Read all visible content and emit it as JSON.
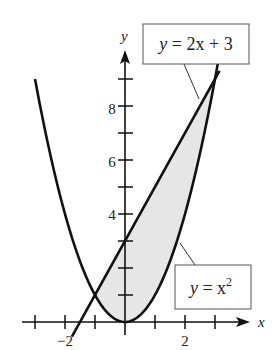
{
  "chart_data": {
    "type": "line",
    "title": "",
    "xlabel": "x",
    "ylabel": "y",
    "xlim": [
      -3.4,
      4.2
    ],
    "ylim": [
      -0.9,
      10
    ],
    "x_ticks": [
      -3,
      -2,
      -1,
      0,
      1,
      2,
      3
    ],
    "x_tick_labels": [
      {
        "value": -2,
        "label": "−2"
      },
      {
        "value": 2,
        "label": "2"
      }
    ],
    "y_ticks": [
      1,
      2,
      3,
      4,
      5,
      6,
      7,
      8,
      9
    ],
    "y_tick_labels": [
      {
        "value": 4,
        "label": "4"
      },
      {
        "value": 6,
        "label": "6"
      },
      {
        "value": 8,
        "label": "8"
      }
    ],
    "grid": false,
    "series": [
      {
        "name": "y = x^2",
        "label": "y = x²",
        "function": "x^2",
        "x_range": [
          -3.0,
          3.25
        ]
      },
      {
        "name": "y = 2x + 3",
        "label": "y = 2x + 3",
        "function": "2x+3",
        "x_range": [
          -1.77,
          3.15
        ]
      }
    ],
    "shaded_region": {
      "between": [
        "y = 2x + 3",
        "y = x^2"
      ],
      "x_range": [
        -1,
        3
      ],
      "color": "#e6e6e6"
    },
    "intersections": [
      {
        "x": -1,
        "y": 1
      },
      {
        "x": 3,
        "y": 9
      }
    ],
    "annotations": [
      {
        "text": "y = 2x + 3",
        "boxed": true
      },
      {
        "text": "y = x²",
        "boxed": true
      }
    ]
  },
  "labels": {
    "axis_x": "x",
    "axis_y": "y",
    "tick_x_neg2": "−2",
    "tick_x_2": "2",
    "tick_y_4": "4",
    "tick_y_6": "6",
    "tick_y_8": "8",
    "line_label_y": "y",
    "line_label_rest": " = 2x + 3",
    "parab_label_y": "y",
    "parab_label_eq": " = x",
    "parab_label_exp": "2"
  }
}
